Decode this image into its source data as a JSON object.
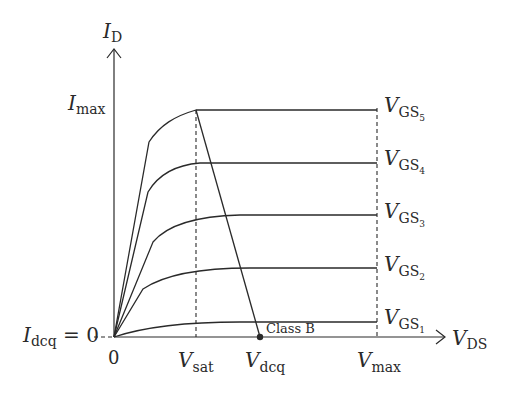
{
  "diagram": {
    "y_axis": {
      "symbol": "I",
      "subscript": "D"
    },
    "x_axis": {
      "symbol": "V",
      "subscript": "DS"
    },
    "y_labels": {
      "imax": {
        "symbol": "I",
        "subscript": "max"
      },
      "idcq": {
        "symbol": "I",
        "subscript": "dcq",
        "suffix": " = 0"
      }
    },
    "x_labels": {
      "origin": "0",
      "vsat": {
        "symbol": "V",
        "subscript": "sat"
      },
      "vdcq": {
        "symbol": "V",
        "subscript": "dcq"
      },
      "vmax": {
        "symbol": "V",
        "subscript": "max"
      }
    },
    "curves": [
      {
        "symbol": "V",
        "subscript": "GS",
        "index": "5",
        "level": 1.0
      },
      {
        "symbol": "V",
        "subscript": "GS",
        "index": "4",
        "level": 0.77
      },
      {
        "symbol": "V",
        "subscript": "GS",
        "index": "3",
        "level": 0.54
      },
      {
        "symbol": "V",
        "subscript": "GS",
        "index": "2",
        "level": 0.305
      },
      {
        "symbol": "V",
        "subscript": "GS",
        "index": "1",
        "level": 0.07
      }
    ],
    "load_line_label": "Class B",
    "q_point": "V_dcq on V_DS axis"
  }
}
